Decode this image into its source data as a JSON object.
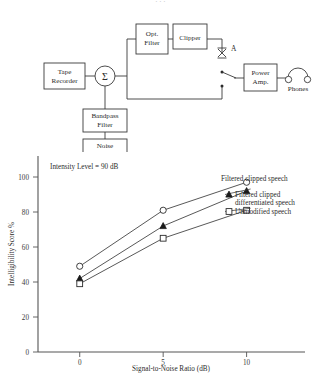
{
  "figure": {
    "cut_caption": ". . ."
  },
  "diagram": {
    "blocks": [
      {
        "id": "tape-recorder",
        "lines": [
          "Tape",
          "Recorder"
        ]
      },
      {
        "id": "opt-filter",
        "lines": [
          "Opt.",
          "Filter"
        ]
      },
      {
        "id": "clipper",
        "lines": [
          "Clipper"
        ]
      },
      {
        "id": "power-amp",
        "lines": [
          "Power",
          "Amp."
        ]
      },
      {
        "id": "bandpass-filter",
        "lines": [
          "Bandpass",
          "Filter"
        ]
      },
      {
        "id": "noise-generator",
        "lines": [
          "Noise",
          "Generator"
        ]
      }
    ],
    "summing_junction": {
      "symbol": "Σ"
    },
    "test_point": {
      "label": "A"
    },
    "output": {
      "label": "Phones"
    }
  },
  "chart_data": {
    "type": "line",
    "title": "",
    "xlabel": "Signal-to-Noise Ratio (dB)",
    "ylabel": "Intelligibility Score %",
    "annotation": "Intensity Level  =  90 dB",
    "x": [
      0,
      5,
      10
    ],
    "xticks": [
      "0",
      "5",
      "10"
    ],
    "yticks": [
      "0",
      "20",
      "40",
      "60",
      "80",
      "100"
    ],
    "xlim": [
      -2.5,
      13.5
    ],
    "ylim": [
      0,
      112
    ],
    "grid": false,
    "legend_position": "right-inline",
    "series": [
      {
        "name": "Filtered clipped speech",
        "marker": "open-circle",
        "values": [
          49,
          81,
          97
        ]
      },
      {
        "name": "Filtered clipped differentiated speech",
        "name_lines": [
          "Filtered clipped",
          "differentiated speech"
        ],
        "marker": "filled-triangle",
        "values": [
          42,
          72,
          92
        ]
      },
      {
        "name": "Unmodified speech",
        "marker": "open-square",
        "values": [
          39,
          65,
          81
        ]
      }
    ]
  }
}
